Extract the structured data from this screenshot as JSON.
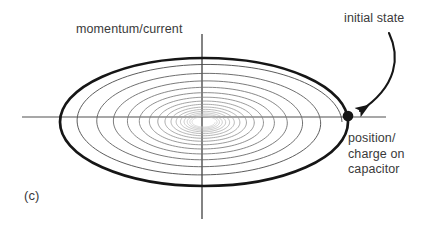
{
  "figure": {
    "panel_label": "(c)",
    "background_color": "#ffffff",
    "text_color": "#3a3a3a"
  },
  "labels": {
    "y_axis": "momentum/current",
    "initial_state": "initial state",
    "x_axis_line1": "position/",
    "x_axis_line2": "charge on",
    "x_axis_line3": "capacitor"
  },
  "chart_data": {
    "type": "line",
    "title": "",
    "subtitle": "",
    "xlabel": "position/charge on capacitor",
    "ylabel": "momentum/current",
    "grid": false,
    "legend": null,
    "axes": {
      "origin": [
        202,
        117
      ],
      "x_axis": {
        "x1": 22,
        "x2": 386,
        "y": 117,
        "color": "#8a8a8a",
        "width": 1.2
      },
      "y_axis": {
        "y1": 34,
        "y2": 219,
        "x": 202,
        "color": "#555555",
        "width": 1.4
      }
    },
    "outer_orbit": {
      "center": [
        204,
        122
      ],
      "rx": 144,
      "ry": 64,
      "color": "#161616",
      "width": 2.6
    },
    "spiral": {
      "turns": 15,
      "start_radius_x": 138,
      "start_radius_y": 60,
      "end_radius_x": 2,
      "end_radius_y": 1,
      "decay_per_turn": 0.845,
      "color_start": "#4a4a4a",
      "color_end": "#c8c8c8",
      "width": 0.9
    },
    "initial_state_point": {
      "x": 348,
      "y": 116,
      "radius": 5.2,
      "color": "#161616",
      "label": "initial state"
    },
    "annotation_arrow": {
      "start": [
        389,
        33
      ],
      "end": [
        357,
        112
      ],
      "color": "#161616",
      "width": 2.0,
      "arrowhead": true
    }
  }
}
